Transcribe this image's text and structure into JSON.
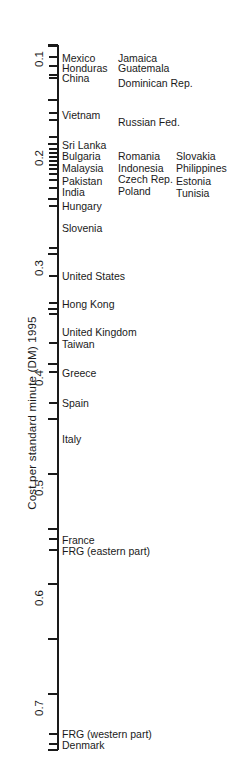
{
  "chart_data": {
    "type": "scatter",
    "orientation": "vertical-number-line",
    "title": "",
    "ylabel": "Cost per standard minute (DM) 1995",
    "xlabel": "",
    "ylim": [
      0.1,
      0.74
    ],
    "grid": false,
    "legend": null,
    "y_ticks": [
      0.1,
      0.2,
      0.3,
      0.4,
      0.5,
      0.6,
      0.7
    ],
    "y_tick_labels": [
      "0.1",
      "0.2",
      "0.3",
      "0.4",
      "0.5",
      "0.6",
      "0.7"
    ],
    "y_minor_ticks": [
      0.15,
      0.25,
      0.35,
      0.45,
      0.55,
      0.65
    ],
    "categories": [
      "Mexico",
      "Jamaica",
      "Honduras",
      "Guatemala",
      "China",
      "Dominican Rep.",
      "Vietnam",
      "Russian Fed.",
      "Sri Lanka",
      "Bulgaria",
      "Romania",
      "Slovakia",
      "Malaysia",
      "Indonesia",
      "Philippines",
      "Czech Rep.",
      "Estonia",
      "Pakistan",
      "Poland",
      "Tunisia",
      "India",
      "Hungary",
      "Slovenia",
      "United States",
      "Hong Kong",
      "United Kingdom",
      "Taiwan",
      "Greece",
      "Spain",
      "Italy",
      "France",
      "FRG (eastern part)",
      "FRG (western part)",
      "Denmark"
    ],
    "values": [
      0.118,
      0.118,
      0.126,
      0.126,
      0.134,
      0.134,
      0.166,
      0.172,
      0.19,
      0.196,
      0.196,
      0.196,
      0.202,
      0.202,
      0.202,
      0.206,
      0.206,
      0.212,
      0.212,
      0.212,
      0.218,
      0.226,
      0.24,
      0.292,
      0.312,
      0.334,
      0.342,
      0.38,
      0.4,
      0.428,
      0.56,
      0.57,
      0.718,
      0.726
    ]
  },
  "axis": {
    "title": "Cost per standard minute (DM) 1995",
    "ticks": [
      {
        "label": "0.1",
        "value": 0.1,
        "y": 45,
        "kind": "major"
      },
      {
        "label": "0.2",
        "value": 0.2,
        "y": 144,
        "kind": "major"
      },
      {
        "label": "0.3",
        "value": 0.3,
        "y": 254,
        "kind": "major"
      },
      {
        "label": "0.4",
        "value": 0.4,
        "y": 364,
        "kind": "major"
      },
      {
        "label": "0.5",
        "value": 0.5,
        "y": 474,
        "kind": "major"
      },
      {
        "label": "0.6",
        "value": 0.6,
        "y": 584,
        "kind": "major"
      },
      {
        "label": "0.7",
        "value": 0.7,
        "y": 694,
        "kind": "major"
      }
    ],
    "minor_ticks": [
      {
        "value": 0.15,
        "y": 100
      },
      {
        "value": 0.25,
        "y": 199
      },
      {
        "value": 0.35,
        "y": 309
      },
      {
        "value": 0.45,
        "y": 419
      },
      {
        "value": 0.55,
        "y": 529
      },
      {
        "value": 0.65,
        "y": 639
      }
    ]
  },
  "data_ticks": [
    {
      "y": 57,
      "bold": false
    },
    {
      "y": 66,
      "bold": false
    },
    {
      "y": 75,
      "bold": false
    },
    {
      "y": 78,
      "bold": false
    },
    {
      "y": 113,
      "bold": false
    },
    {
      "y": 120,
      "bold": false
    },
    {
      "y": 137,
      "bold": false
    },
    {
      "y": 144,
      "bold": false
    },
    {
      "y": 149,
      "bold": false
    },
    {
      "y": 153,
      "bold": false
    },
    {
      "y": 157,
      "bold": false
    },
    {
      "y": 161,
      "bold": false
    },
    {
      "y": 165,
      "bold": false
    },
    {
      "y": 169,
      "bold": false
    },
    {
      "y": 174,
      "bold": true
    },
    {
      "y": 180,
      "bold": false
    },
    {
      "y": 188,
      "bold": false
    },
    {
      "y": 206,
      "bold": false
    },
    {
      "y": 248,
      "bold": false
    },
    {
      "y": 276,
      "bold": false
    },
    {
      "y": 303,
      "bold": false
    },
    {
      "y": 314,
      "bold": false
    },
    {
      "y": 343,
      "bold": false
    },
    {
      "y": 372,
      "bold": false
    },
    {
      "y": 403,
      "bold": false
    },
    {
      "y": 539,
      "bold": false
    },
    {
      "y": 550,
      "bold": false
    },
    {
      "y": 734,
      "bold": false
    },
    {
      "y": 744,
      "bold": false
    }
  ],
  "labels": {
    "column1": [
      {
        "text": "Mexico",
        "y": 53
      },
      {
        "text": "Honduras",
        "y": 63
      },
      {
        "text": "China",
        "y": 73
      },
      {
        "text": "Vietnam",
        "y": 110
      },
      {
        "text": "Sri Lanka",
        "y": 140
      },
      {
        "text": "Bulgaria",
        "y": 151
      },
      {
        "text": "Malaysia",
        "y": 163
      },
      {
        "text": "Pakistan",
        "y": 176
      },
      {
        "text": "India",
        "y": 187
      },
      {
        "text": "Hungary",
        "y": 201
      },
      {
        "text": "Slovenia",
        "y": 223
      },
      {
        "text": "United States",
        "y": 271
      },
      {
        "text": "Hong Kong",
        "y": 299
      },
      {
        "text": "United Kingdom",
        "y": 327
      },
      {
        "text": "Taiwan",
        "y": 339
      },
      {
        "text": "Greece",
        "y": 368
      },
      {
        "text": "Spain",
        "y": 398
      },
      {
        "text": "Italy",
        "y": 434
      },
      {
        "text": "France",
        "y": 535
      },
      {
        "text": "FRG (eastern part)",
        "y": 546
      },
      {
        "text": "FRG (western part)",
        "y": 729
      },
      {
        "text": "Denmark",
        "y": 740
      }
    ],
    "column2": [
      {
        "text": "Jamaica",
        "y": 53
      },
      {
        "text": "Guatemala",
        "y": 63
      },
      {
        "text": "Dominican Rep.",
        "y": 78
      },
      {
        "text": "Russian Fed.",
        "y": 117
      },
      {
        "text": "Romania",
        "y": 151
      },
      {
        "text": "Indonesia",
        "y": 163
      },
      {
        "text": "Czech Rep.",
        "y": 174
      },
      {
        "text": "Poland",
        "y": 186
      }
    ],
    "column3": [
      {
        "text": "Slovakia",
        "y": 151
      },
      {
        "text": "Philippines",
        "y": 163
      },
      {
        "text": "Estonia",
        "y": 176
      },
      {
        "text": "Tunisia",
        "y": 188
      }
    ]
  }
}
